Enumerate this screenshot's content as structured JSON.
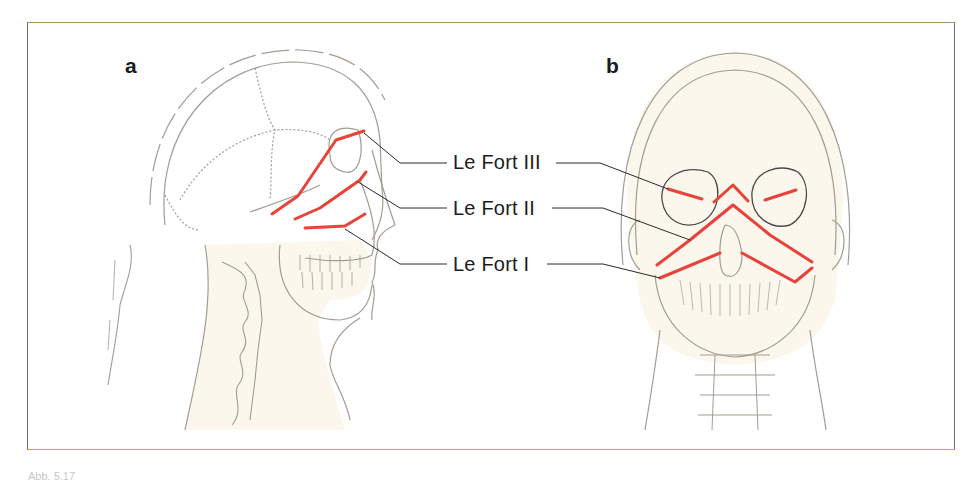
{
  "figure": {
    "panels": [
      {
        "id": "a",
        "letter": "a",
        "view": "lateral skull"
      },
      {
        "id": "b",
        "letter": "b",
        "view": "frontal skull"
      }
    ],
    "labels": {
      "lefort3": "Le Fort III",
      "lefort2": "Le Fort II",
      "lefort1": "Le Fort I"
    },
    "caption": "Abb. 5.17",
    "colors": {
      "fracture_line": "#e8433a",
      "outline": "#9a938a",
      "skin_fill": "#fbf7ec",
      "leader": "#2a2a2a",
      "frame": "#6b6b6b",
      "frame_accent": "#c9a948"
    }
  }
}
